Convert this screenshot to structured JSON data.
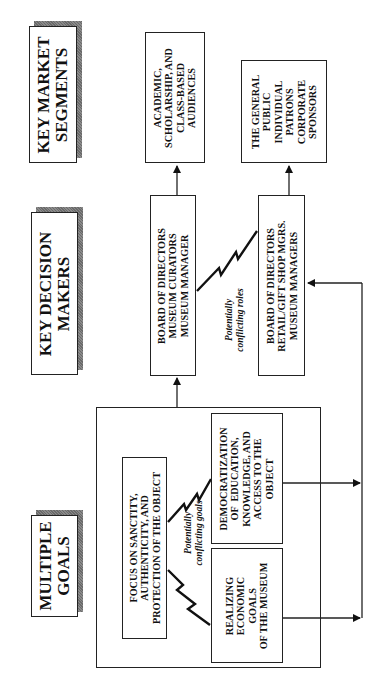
{
  "headers": {
    "segments": [
      "KEY MARKET",
      "SEGMENTS"
    ],
    "decision_makers": [
      "KEY DECISION",
      "MAKERS"
    ],
    "goals": [
      "MULTIPLE",
      "GOALS"
    ]
  },
  "segments": {
    "academic": [
      "ACADEMIC,",
      "SCHOLARSHIP, AND",
      "CLASS-BASED",
      "AUDIENCES"
    ],
    "general": [
      "THE GENERAL",
      "PUBLIC",
      "INDIVIDUAL",
      "PATRONS",
      "CORPORATE",
      "SPONSORS"
    ]
  },
  "decision_makers": {
    "curatorial": [
      "BOARD OF DIRECTORS",
      "MUSEUM CURATORS",
      "MUSEUM MANAGER"
    ],
    "commercial": [
      "BOARD OF DIRECTORS",
      "RETAIL/GIFT SHOP MGRS.",
      "MUSEUM MANAGERS"
    ]
  },
  "goals": {
    "focus": [
      "FOCUS ON SANCTITY,",
      "AUTHENTICITY, AND",
      "PROTECTION OF THE OBJECT"
    ],
    "democratization": [
      "DEMOCRATIZATION",
      "OF  EDUCATION,",
      "KNOWLEDGE, AND",
      "ACCESS TO THE",
      "OBJECT"
    ],
    "economic": [
      "REALIZING",
      "ECONOMIC",
      "GOALS",
      "OF THE MUSEUM"
    ]
  },
  "annotations": {
    "roles": [
      "Potentially",
      "conflicting roles"
    ],
    "goals": [
      "Potentially",
      "conflicting goals"
    ]
  }
}
